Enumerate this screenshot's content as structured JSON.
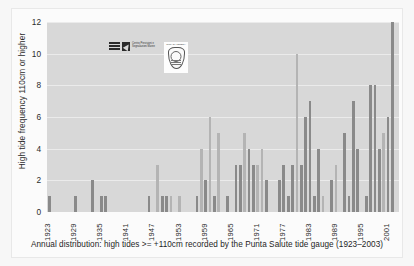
{
  "figure": {
    "caption": "Annual distribution: high tides >= +110cm recorded by the Punta Salute tide gauge (1923–2003)",
    "ytitle": "High tide frequency 110cm or higher",
    "logo_primary_text": "Centro Previsioni e Segnalazioni Maree",
    "logo_secondary_text": "CITTA DI VENEZIA"
  },
  "colors": {
    "plot_background": "#d8d8d8",
    "bar_dark": "#8a8a8a",
    "bar_light": "#b4b4b4",
    "gridline": "#ebebeb",
    "text": "#2b2b2b",
    "page_background": "#f7f7f7"
  },
  "chart_data": {
    "type": "bar",
    "title": "",
    "subtitle": "",
    "xlabel": "",
    "ylabel": "High tide frequency 110cm or higher",
    "ylim": [
      0,
      12
    ],
    "yticks": [
      0,
      2,
      4,
      6,
      8,
      10,
      12
    ],
    "xtick_labels": [
      "1923",
      "1929",
      "1935",
      "1941",
      "1947",
      "1953",
      "1959",
      "1965",
      "1971",
      "1977",
      "1983",
      "1989",
      "1995",
      "2001"
    ],
    "xtick_years": [
      1923,
      1929,
      1935,
      1941,
      1947,
      1953,
      1959,
      1965,
      1971,
      1977,
      1983,
      1989,
      1995,
      2001
    ],
    "grid": true,
    "legend": "none",
    "xlim": [
      1923,
      2003
    ],
    "categories": [
      1923,
      1924,
      1925,
      1926,
      1927,
      1928,
      1929,
      1930,
      1931,
      1932,
      1933,
      1934,
      1935,
      1936,
      1937,
      1938,
      1939,
      1940,
      1941,
      1942,
      1943,
      1944,
      1945,
      1946,
      1947,
      1948,
      1949,
      1950,
      1951,
      1952,
      1953,
      1954,
      1955,
      1956,
      1957,
      1958,
      1959,
      1960,
      1961,
      1962,
      1963,
      1964,
      1965,
      1966,
      1967,
      1968,
      1969,
      1970,
      1971,
      1972,
      1973,
      1974,
      1975,
      1976,
      1977,
      1978,
      1979,
      1980,
      1981,
      1982,
      1983,
      1984,
      1985,
      1986,
      1987,
      1988,
      1989,
      1990,
      1991,
      1992,
      1993,
      1994,
      1995,
      1996,
      1997,
      1998,
      1999,
      2000,
      2001,
      2002,
      2003
    ],
    "values": [
      1,
      0,
      0,
      0,
      0,
      0,
      1,
      0,
      0,
      0,
      2,
      0,
      1,
      1,
      0,
      0,
      0,
      0,
      0,
      0,
      0,
      0,
      0,
      1,
      0,
      3,
      1,
      1,
      1,
      0,
      1,
      0,
      0,
      0,
      1,
      4,
      2,
      6,
      1,
      5,
      0,
      1,
      0,
      3,
      3,
      5,
      4,
      3,
      3,
      4,
      2,
      0,
      0,
      2,
      3,
      1,
      3,
      10,
      3,
      6,
      7,
      1,
      4,
      1,
      0,
      2,
      3,
      0,
      5,
      1,
      7,
      4,
      0,
      1,
      8,
      8,
      4,
      5,
      6,
      12,
      0
    ],
    "bar_shades": [
      "dark",
      "none",
      "none",
      "none",
      "none",
      "none",
      "dark",
      "none",
      "none",
      "none",
      "dark",
      "none",
      "dark",
      "dark",
      "none",
      "none",
      "none",
      "none",
      "none",
      "none",
      "none",
      "none",
      "none",
      "dark",
      "none",
      "light",
      "dark",
      "dark",
      "light",
      "none",
      "light",
      "none",
      "none",
      "none",
      "dark",
      "light",
      "dark",
      "light",
      "dark",
      "light",
      "none",
      "dark",
      "none",
      "dark",
      "dark",
      "light",
      "dark",
      "dark",
      "light",
      "light",
      "dark",
      "none",
      "none",
      "dark",
      "dark",
      "dark",
      "dark",
      "light",
      "dark",
      "dark",
      "dark",
      "dark",
      "dark",
      "light",
      "none",
      "dark",
      "light",
      "none",
      "dark",
      "dark",
      "dark",
      "dark",
      "none",
      "dark",
      "dark",
      "dark",
      "dark",
      "light",
      "dark",
      "dark",
      "none"
    ]
  }
}
